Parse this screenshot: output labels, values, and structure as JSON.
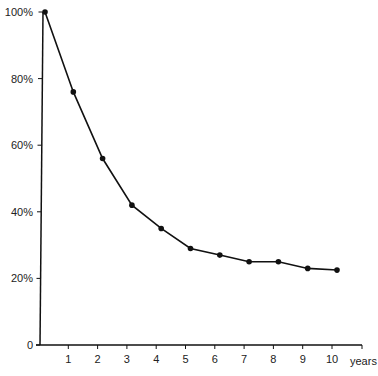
{
  "chart_data": {
    "type": "line",
    "title": "",
    "xlabel": "years",
    "ylabel": "",
    "x": [
      0,
      1,
      2,
      3,
      4,
      5,
      6,
      7,
      8,
      9,
      10
    ],
    "series": [
      {
        "name": "",
        "values": [
          100,
          76,
          56,
          42,
          35,
          29,
          27,
          25,
          25,
          23,
          22.5
        ]
      }
    ],
    "x_ticks": [
      "1",
      "2",
      "3",
      "4",
      "5",
      "6",
      "7",
      "8",
      "9",
      "10"
    ],
    "y_ticks": [
      "0",
      "20%",
      "40%",
      "60%",
      "80%",
      "100%"
    ],
    "xlim": [
      0,
      11
    ],
    "ylim": [
      0,
      100
    ],
    "grid": false,
    "legend": "none",
    "markers": true,
    "line_color": "#111111"
  }
}
